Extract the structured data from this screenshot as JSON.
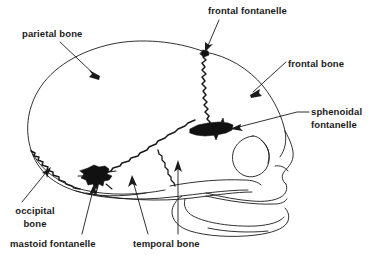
{
  "figure": {
    "background_color": "#ffffff",
    "ink_color": "#1a1a1a",
    "fontanelle_fill": "#111111",
    "width": 368,
    "height": 255
  },
  "labels": {
    "parietal_bone": "parietal bone",
    "frontal_fontanelle": "frontal fontanelle",
    "frontal_bone": "frontal bone",
    "sphenoidal_fontanelle": "sphenoidal\nfontanelle",
    "occipital_bone": "occipital\nbone",
    "mastoid_fontanelle": "mastoid fontanelle",
    "temporal_bone": "temporal bone"
  },
  "structures": [
    {
      "name": "parietal-bone",
      "kind": "bone",
      "label": "parietal bone"
    },
    {
      "name": "frontal-bone",
      "kind": "bone",
      "label": "frontal bone"
    },
    {
      "name": "occipital-bone",
      "kind": "bone",
      "label": "occipital bone"
    },
    {
      "name": "temporal-bone",
      "kind": "bone",
      "label": "temporal bone"
    },
    {
      "name": "frontal-fontanelle",
      "kind": "fontanelle",
      "label": "frontal fontanelle"
    },
    {
      "name": "sphenoidal-fontanelle",
      "kind": "fontanelle",
      "label": "sphenoidal fontanelle"
    },
    {
      "name": "mastoid-fontanelle",
      "kind": "fontanelle",
      "label": "mastoid fontanelle"
    }
  ]
}
